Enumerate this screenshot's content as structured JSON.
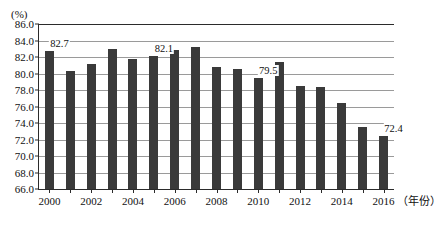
{
  "chart_data": {
    "type": "bar",
    "title": "",
    "subtitle": "",
    "xlabel": "（年份）",
    "ylabel": "(%)",
    "unit_caption": "(%)",
    "categories": [
      "2000",
      "2001",
      "2002",
      "2003",
      "2004",
      "2005",
      "2006",
      "2007",
      "2008",
      "2009",
      "2010",
      "2011",
      "2012",
      "2013",
      "2014",
      "2015",
      "2016"
    ],
    "values": [
      82.7,
      80.3,
      81.2,
      83.0,
      81.8,
      82.1,
      82.8,
      83.2,
      80.8,
      80.5,
      79.5,
      81.4,
      78.5,
      78.4,
      76.4,
      73.5,
      72.4
    ],
    "ylim": [
      66.0,
      86.0
    ],
    "ytick_step": 2.0,
    "ytick_labels": [
      "86.0",
      "84.0",
      "82.0",
      "80.0",
      "78.0",
      "76.0",
      "74.0",
      "72.0",
      "70.0",
      "68.0",
      "66.0"
    ],
    "ytick_values": [
      86.0,
      84.0,
      82.0,
      80.0,
      78.0,
      76.0,
      74.0,
      72.0,
      70.0,
      68.0,
      66.0
    ],
    "xtick_labels": [
      "2000",
      "2002",
      "2004",
      "2006",
      "2008",
      "2010",
      "2012",
      "2014",
      "2016"
    ],
    "xtick_categories": [
      "2000",
      "2002",
      "2004",
      "2006",
      "2008",
      "2010",
      "2012",
      "2014",
      "2016"
    ],
    "grid": true,
    "legend": "none",
    "series": [
      {
        "name": "",
        "values": [
          82.7,
          80.3,
          81.2,
          83.0,
          81.8,
          82.1,
          82.8,
          83.2,
          80.8,
          80.5,
          79.5,
          81.4,
          78.5,
          78.4,
          76.4,
          73.5,
          72.4
        ]
      }
    ],
    "annotations": [
      {
        "category": "2000",
        "text": "82.7",
        "value": 82.7
      },
      {
        "category": "2005",
        "text": "82.1",
        "value": 82.1
      },
      {
        "category": "2010",
        "text": "79.5",
        "value": 79.5
      },
      {
        "category": "2016",
        "text": "72.4",
        "value": 72.4
      }
    ],
    "bar_color": "#3a3a3a",
    "grid_color": "#9a9a9a",
    "axis_color": "#2b2b2b"
  }
}
